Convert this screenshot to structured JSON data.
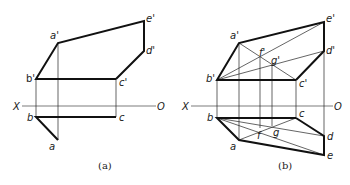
{
  "figures": [
    {
      "id": "a",
      "caption": "(a)",
      "axis": {
        "left_label": "X",
        "right_label": "O"
      },
      "labels": {
        "a_prime": "a'",
        "b_prime": "b'",
        "c_prime": "c'",
        "d_prime": "d'",
        "e_prime": "e'",
        "a": "a",
        "b": "b",
        "c": "c"
      }
    },
    {
      "id": "b",
      "caption": "(b)",
      "axis": {
        "left_label": "X",
        "right_label": "O"
      },
      "labels": {
        "a_prime": "a'",
        "b_prime": "b'",
        "c_prime": "c'",
        "d_prime": "d'",
        "e_prime": "e'",
        "f_prime": "f'",
        "g_prime": "g'",
        "a": "a",
        "b": "b",
        "c": "c",
        "d": "d",
        "e": "e",
        "f": "f",
        "g": "g"
      }
    }
  ]
}
